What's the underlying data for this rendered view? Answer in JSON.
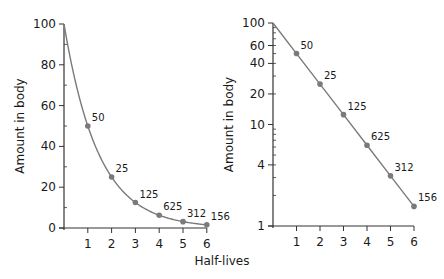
{
  "chart_data": [
    {
      "type": "line",
      "title": "",
      "xlabel": "Half-lives",
      "ylabel": "Amount in body",
      "yscale": "linear",
      "ylim": [
        0,
        100
      ],
      "xlim": [
        0,
        6
      ],
      "yticks": [
        0,
        20,
        40,
        60,
        80,
        100
      ],
      "ytick_labels": [
        "0",
        "20",
        "40",
        "60",
        "80",
        "100"
      ],
      "xticks": [
        1,
        2,
        3,
        4,
        5,
        6
      ],
      "xtick_labels": [
        "1",
        "2",
        "3",
        "4",
        "5",
        "6"
      ],
      "grid": false,
      "series": [
        {
          "name": "Amount in body",
          "x": [
            0,
            1,
            2,
            3,
            4,
            5,
            6
          ],
          "values": [
            100,
            50,
            25,
            12.5,
            6.25,
            3.12,
            1.56
          ],
          "point_labels": [
            "",
            "50",
            "25",
            "125",
            "625",
            "312",
            "156"
          ]
        }
      ]
    },
    {
      "type": "line",
      "title": "",
      "xlabel": "Half-lives",
      "ylabel": "Amount in body",
      "yscale": "log",
      "ylim": [
        1,
        100
      ],
      "xlim": [
        0,
        6
      ],
      "yticks": [
        1,
        4,
        10,
        20,
        40,
        60,
        100
      ],
      "ytick_labels": [
        "1",
        "4",
        "10",
        "20",
        "40",
        "60",
        "100"
      ],
      "xticks": [
        1,
        2,
        3,
        4,
        5,
        6
      ],
      "xtick_labels": [
        "1",
        "2",
        "3",
        "4",
        "5",
        "6"
      ],
      "grid": false,
      "series": [
        {
          "name": "Amount in body",
          "x": [
            0,
            1,
            2,
            3,
            4,
            5,
            6
          ],
          "values": [
            100,
            50,
            25,
            12.5,
            6.25,
            3.12,
            1.56
          ],
          "point_labels": [
            "",
            "50",
            "25",
            "125",
            "625",
            "312",
            "156"
          ]
        }
      ]
    }
  ],
  "shared_xlabel": "Half-lives",
  "colors": {
    "line": "#7a7a7a",
    "point": "#7a7a7a",
    "axis": "#333333"
  }
}
